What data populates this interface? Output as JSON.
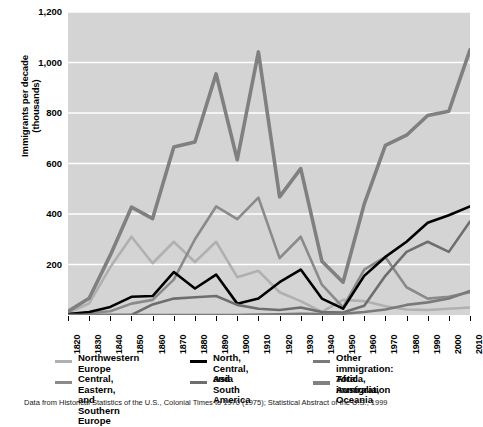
{
  "chart_data": {
    "type": "line",
    "title": "",
    "xlabel": "",
    "ylabel": "Immigrants per decade\n(thousands)",
    "xlim": [
      1820,
      2010
    ],
    "ylim": [
      0,
      1200
    ],
    "yticks": [
      0,
      200,
      400,
      600,
      800,
      1000,
      1200
    ],
    "ytick_labels": [
      "",
      "200",
      "400",
      "600",
      "800",
      "1,000",
      "1,200"
    ],
    "grid": "horizontal",
    "legend_position": "below",
    "x": [
      1820,
      1830,
      1840,
      1850,
      1860,
      1870,
      1880,
      1890,
      1900,
      1910,
      1920,
      1930,
      1940,
      1950,
      1960,
      1970,
      1980,
      1990,
      2000,
      2010
    ],
    "xtick_labels": [
      "1820",
      "1830",
      "1840",
      "1850",
      "1860",
      "1870",
      "1880",
      "1890",
      "1900",
      "1910",
      "1920",
      "1930",
      "1940",
      "1950",
      "1960",
      "1970",
      "1980",
      "1990",
      "2000",
      "2010"
    ],
    "series": [
      {
        "name": "Northwestern Europe",
        "color": "#b0b0b0",
        "width": 2.6,
        "values": [
          8,
          46,
          190,
          310,
          205,
          290,
          210,
          290,
          150,
          175,
          90,
          55,
          12,
          60,
          55,
          35,
          22,
          20,
          25,
          30
        ]
      },
      {
        "name": "Central, Eastern, and Southern Europe",
        "color": "#8a8a8a",
        "width": 2.6,
        "values": [
          2,
          8,
          15,
          45,
          60,
          140,
          300,
          430,
          380,
          465,
          225,
          310,
          120,
          30,
          180,
          230,
          110,
          65,
          72,
          90
        ]
      },
      {
        "name": "North, Central, and South America",
        "color": "#000000",
        "width": 2.6,
        "values": [
          4,
          12,
          32,
          72,
          75,
          170,
          105,
          160,
          45,
          65,
          130,
          180,
          65,
          25,
          155,
          230,
          290,
          365,
          395,
          430
        ]
      },
      {
        "name": "Asia",
        "color": "#6e6e6e",
        "width": 2.6,
        "values": [
          0,
          0,
          0,
          0,
          42,
          65,
          70,
          75,
          40,
          25,
          20,
          30,
          12,
          10,
          37,
          155,
          250,
          290,
          250,
          370
        ]
      },
      {
        "name": "Other immigration: Africa, Australia, Oceania",
        "color": "#7a7a7a",
        "width": 2.6,
        "values": [
          0,
          0,
          0,
          0,
          0,
          0,
          0,
          0,
          0,
          2,
          3,
          5,
          4,
          5,
          12,
          22,
          40,
          50,
          65,
          95
        ]
      },
      {
        "name": "Total immigration",
        "color": "#808080",
        "width": 3.6,
        "values": [
          14,
          66,
          237,
          427,
          382,
          665,
          685,
          955,
          615,
          1042,
          468,
          580,
          213,
          130,
          439,
          672,
          712,
          790,
          807,
          1050
        ]
      }
    ]
  },
  "axis": {
    "y_title_line1": "Immigrants per decade",
    "y_title_line2": "(thousands)"
  },
  "legend": {
    "columns": [
      {
        "items": [
          {
            "label": "Northwestern\nEurope",
            "color": "#b0b0b0",
            "thick": false
          },
          {
            "label": "Central, Eastern, and\nSouthern Europe",
            "color": "#8a8a8a",
            "thick": false
          }
        ]
      },
      {
        "items": [
          {
            "label": "North, Central,\nand South America",
            "color": "#000000",
            "thick": false
          },
          {
            "label": "Asia",
            "color": "#6e6e6e",
            "thick": false
          }
        ]
      },
      {
        "items": [
          {
            "label": "Other immigration:\nAfrica, Australia, Oceania",
            "color": "#7a7a7a",
            "thick": false
          },
          {
            "label": "Total immigration",
            "color": "#808080",
            "thick": true
          }
        ]
      }
    ]
  },
  "caption": {
    "text": "Data from Historical Statistics of the U.S., Colonial Times to 1970 (1975); Statistical Abstract of the U.S., 1999"
  },
  "colors": {
    "plot_background": "#d4d4d4",
    "gridline": "#ffffff",
    "page_background": "#ffffff"
  }
}
